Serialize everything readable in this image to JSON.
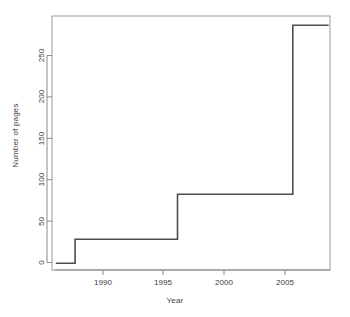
{
  "chart_data": {
    "type": "line",
    "subtype": "step",
    "title": "",
    "xlabel": "Year",
    "ylabel": "Number of pages",
    "xlim": [
      1986.2,
      1987.9
    ],
    "x": [
      1986.5,
      1988,
      1996,
      2005,
      2007.8
    ],
    "values": [
      0,
      29,
      83,
      286,
      286
    ],
    "steps": [
      {
        "x_start": 1986.5,
        "x_end": 1988.0,
        "y": 0
      },
      {
        "x_start": 1988.0,
        "x_end": 1996.0,
        "y": 29
      },
      {
        "x_start": 1996.0,
        "x_end": 2005.0,
        "y": 83
      },
      {
        "x_start": 2005.0,
        "x_end": 2007.8,
        "y": 286
      }
    ],
    "x_ticks": [
      1990,
      1995,
      2000,
      2005
    ],
    "x_tick_labels": [
      "1990",
      "1995",
      "2000",
      "2005"
    ],
    "y_ticks": [
      0,
      50,
      100,
      150,
      200,
      250
    ],
    "y_tick_labels": [
      "0",
      "50",
      "100",
      "150",
      "200",
      "250"
    ],
    "x_range": [
      1986.2,
      2007.9
    ],
    "y_range": [
      -8,
      297
    ],
    "grid": false,
    "legend": null,
    "line_color": "#4d4d4d",
    "axis_color": "#808080",
    "background_color": "#ffffff",
    "box": true
  }
}
